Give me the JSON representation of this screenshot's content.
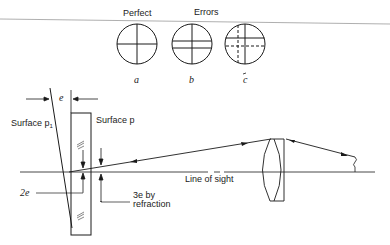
{
  "figure": {
    "reticle_group": {
      "perfect_label": "Perfect",
      "errors_label": "Errors",
      "reticles": [
        {
          "id": "a",
          "label": "a",
          "state": "perfect"
        },
        {
          "id": "b",
          "label": "b",
          "state": "error-double-horizontal"
        },
        {
          "id": "c",
          "label": "c",
          "state": "error-double-crosshair"
        }
      ]
    },
    "optics": {
      "e_label": "e",
      "surface_p1_label": "Surface p",
      "surface_p1_subscript": "1",
      "surface_p_label": "Surface p",
      "two_e_label": "2e",
      "three_e_label_line1": "3e by",
      "three_e_label_line2": "refraction",
      "line_of_sight_label": "Line of sight"
    },
    "colors": {
      "stroke": "#1a1a1a",
      "background": "#ffffff"
    }
  }
}
